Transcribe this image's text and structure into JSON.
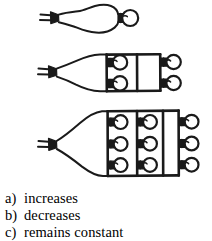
{
  "figure": {
    "ink_color": "#1a1a1a",
    "background_color": "#ffffff",
    "circuits": [
      {
        "id": "circuit-1",
        "label": "one bulb",
        "bulb_count": 1,
        "rows": 1,
        "columns": 1,
        "has_plug": true,
        "plug_prongs": 2
      },
      {
        "id": "circuit-2",
        "label": "four bulbs",
        "bulb_count": 4,
        "rows": 2,
        "columns": 2,
        "has_plug": true,
        "plug_prongs": 2
      },
      {
        "id": "circuit-3",
        "label": "nine bulbs",
        "bulb_count": 9,
        "rows": 3,
        "columns": 3,
        "has_plug": true,
        "plug_prongs": 2
      }
    ]
  },
  "answers": {
    "options": [
      {
        "marker": "a)",
        "text": "increases"
      },
      {
        "marker": "b)",
        "text": "decreases"
      },
      {
        "marker": "c)",
        "text": "remains constant"
      }
    ]
  }
}
